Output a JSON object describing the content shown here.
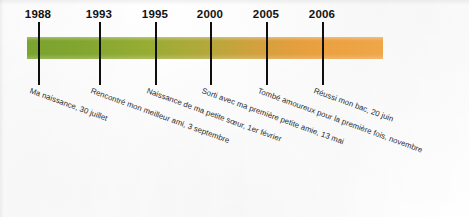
{
  "diagram": {
    "kind": "personal-life-timeline",
    "language": "fr",
    "bar": {
      "start_color": "#7ca52f",
      "mid_color": "#b0a93a",
      "end_color": "#f4aa4b"
    },
    "events": [
      {
        "year": "1988",
        "description": "Ma naissance, 30 juillet",
        "tick_x": 38,
        "year_x": 38,
        "label_x": 30,
        "label_y": 86
      },
      {
        "year": "1993",
        "description": "Rencontré mon meilleur ami, 3 septembre",
        "tick_x": 99,
        "year_x": 99,
        "label_x": 91,
        "label_y": 86
      },
      {
        "year": "1995",
        "description": "Naissance de ma petite sœur, 1er février",
        "tick_x": 155,
        "year_x": 155,
        "label_x": 147,
        "label_y": 86
      },
      {
        "year": "2000",
        "description": "Sorti avec ma première petite amie, 13 mai",
        "tick_x": 210,
        "year_x": 210,
        "label_x": 202,
        "label_y": 86
      },
      {
        "year": "2005",
        "description": "Tombé amoureux pour la première fois, novembre",
        "tick_x": 266,
        "year_x": 266,
        "label_x": 258,
        "label_y": 86
      },
      {
        "year": "2006",
        "description": "Réussi mon bac, 20 juin",
        "tick_x": 322,
        "year_x": 322,
        "label_x": 314,
        "label_y": 86
      }
    ]
  }
}
